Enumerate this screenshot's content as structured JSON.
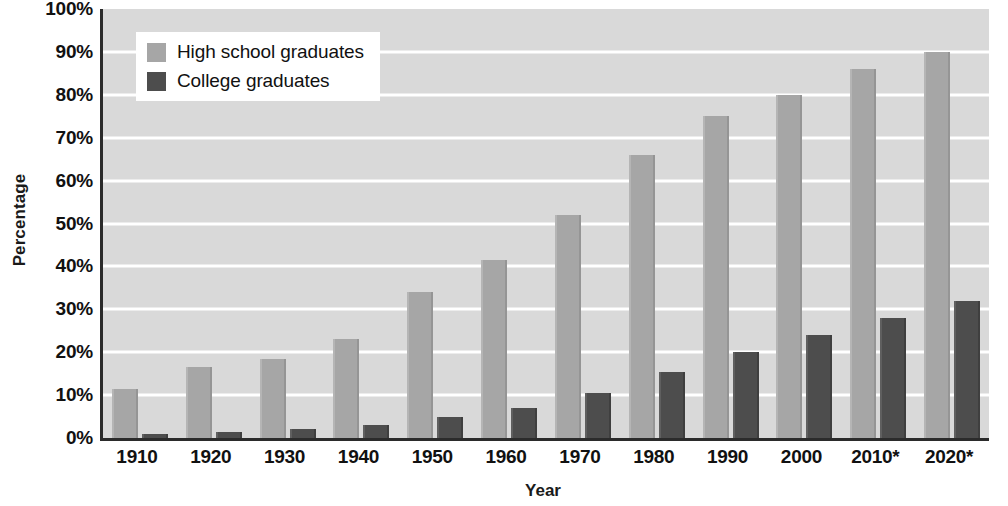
{
  "chart_data": {
    "type": "bar",
    "title": "",
    "xlabel": "Year",
    "ylabel": "Percentage",
    "ylim": [
      0,
      100
    ],
    "grid": true,
    "legend_position": "top-left",
    "categories": [
      "1910",
      "1920",
      "1930",
      "1940",
      "1950",
      "1960",
      "1970",
      "1980",
      "1990",
      "2000",
      "2010*",
      "2020*"
    ],
    "y_ticks": [
      "0%",
      "10%",
      "20%",
      "30%",
      "40%",
      "50%",
      "60%",
      "70%",
      "80%",
      "90%",
      "100%"
    ],
    "y_tick_values": [
      0,
      10,
      20,
      30,
      40,
      50,
      60,
      70,
      80,
      90,
      100
    ],
    "series": [
      {
        "name": "High school graduates",
        "color": "#a6a6a6",
        "values": [
          11.5,
          16.5,
          18.5,
          23,
          34,
          41.5,
          52,
          66,
          75,
          80,
          86,
          90
        ]
      },
      {
        "name": "College graduates",
        "color": "#4d4d4d",
        "values": [
          1,
          1.3,
          2,
          3,
          5,
          7,
          10.5,
          15.5,
          20,
          24,
          28,
          32
        ]
      }
    ]
  },
  "legend": {
    "items": [
      {
        "label": "High school graduates",
        "swatch": "hs"
      },
      {
        "label": "College graduates",
        "swatch": "col"
      }
    ]
  },
  "colors": {
    "plot_background": "#d9d9d9",
    "gridline": "#ffffff",
    "axis": "#2b2b2b",
    "text": "#111111",
    "high_school": "#a6a6a6",
    "college": "#4d4d4d"
  }
}
